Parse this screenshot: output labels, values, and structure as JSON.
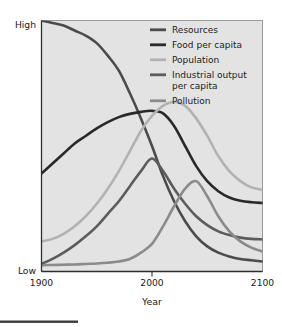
{
  "chart_data": {
    "type": "line",
    "title": "",
    "xlabel": "Year",
    "ylabel": "",
    "x": [
      1900,
      1910,
      1920,
      1930,
      1940,
      1950,
      1960,
      1970,
      1980,
      1990,
      2000,
      2010,
      2020,
      2030,
      2040,
      2050,
      2060,
      2070,
      2080,
      2090,
      2100
    ],
    "xlim": [
      1900,
      2100
    ],
    "ylim": [
      "Low",
      "High"
    ],
    "xticks": [
      "1900",
      "2000",
      "2100"
    ],
    "xtick_values": [
      1900,
      2000,
      2100
    ],
    "yticks": [
      "Low",
      "High"
    ],
    "ytick_labels": {
      "high": "High",
      "low": "Low"
    },
    "grid": false,
    "legend_position": "top-right",
    "plot_background": "#e3e3e3",
    "series": [
      {
        "name": "Resources",
        "color": "#4b4b4b",
        "width": 2.6,
        "values": [
          100,
          99,
          98,
          96,
          94,
          91,
          86,
          80,
          71,
          61,
          50,
          38,
          28,
          20,
          14,
          10,
          7.5,
          6,
          5,
          4.5,
          4
        ]
      },
      {
        "name": "Food per capita",
        "color": "#292929",
        "width": 2.6,
        "values": [
          39,
          43,
          47,
          51,
          54,
          57,
          59.5,
          61.5,
          62.8,
          63.6,
          64,
          63,
          58,
          50,
          42,
          36,
          32,
          29.5,
          28.2,
          27.6,
          27.3
        ]
      },
      {
        "name": "Population",
        "color": "#b2b2b2",
        "width": 2.6,
        "values": [
          12,
          13,
          15,
          18,
          22,
          27,
          33,
          40,
          48,
          56,
          62,
          66,
          67.5,
          66,
          61,
          54,
          46,
          40,
          36,
          33.5,
          32.5
        ]
      },
      {
        "name": "Industrial output per capita",
        "color": "#5c5c5c",
        "width": 2.6,
        "values": [
          3,
          5,
          7.5,
          10.5,
          14,
          18,
          23,
          28,
          34,
          40,
          45,
          40,
          33,
          27,
          22,
          18.5,
          16,
          14.5,
          13.5,
          13,
          12.8
        ]
      },
      {
        "name": "Pollution",
        "color": "#8b8b8b",
        "width": 2.6,
        "values": [
          2.5,
          2.6,
          2.7,
          2.8,
          3,
          3.2,
          3.5,
          4,
          5,
          7.5,
          11,
          18,
          26,
          33,
          36,
          30,
          22,
          16,
          12,
          9.5,
          8
        ]
      }
    ]
  },
  "axes": {
    "y_high_label": "High",
    "y_low_label": "Low",
    "x_start_label": "1900",
    "x_mid_label": "2000",
    "x_end_label": "2100",
    "x_axis_title": "Year"
  },
  "legend": {
    "items": [
      {
        "label": "Resources",
        "color": "#4b4b4b"
      },
      {
        "label": "Food per capita",
        "color": "#292929"
      },
      {
        "label": "Population",
        "color": "#b2b2b2"
      },
      {
        "label": "Industrial output",
        "label_line2": "per capita",
        "color": "#5c5c5c"
      },
      {
        "label": "Pollution",
        "color": "#8b8b8b"
      }
    ]
  },
  "footer": {
    "bar_color": "#3c3c3c"
  }
}
